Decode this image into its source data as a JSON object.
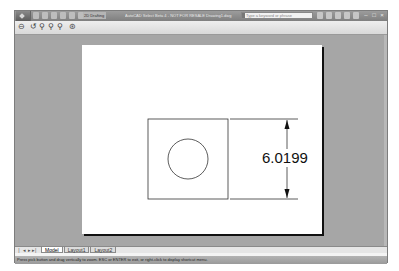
{
  "window": {
    "title": "AutoCAD Select Beta 4 - NOT FOR RESALE   Drawing1.dwg",
    "workspace": "2D Drafting",
    "search_placeholder": "Type a keyword or phrase",
    "controls": [
      "minimize",
      "maximize",
      "close"
    ],
    "control_glyphs": [
      "–",
      "□",
      "×"
    ]
  },
  "toolbar": {
    "buttons": [
      {
        "name": "pan",
        "glyph": "⊖"
      },
      {
        "name": "realtime-zoom",
        "glyph": "↺"
      },
      {
        "name": "zoom-window",
        "glyph": "⚲"
      },
      {
        "name": "zoom-previous",
        "glyph": "⚲"
      },
      {
        "name": "zoom-extents",
        "glyph": "⚲"
      },
      {
        "name": "orbit",
        "glyph": "⊛"
      }
    ]
  },
  "drawing": {
    "dimension_value": "6.0199",
    "objects": [
      {
        "type": "rectangle",
        "label": "square"
      },
      {
        "type": "circle",
        "label": "circle"
      },
      {
        "type": "linear-dimension",
        "label": "vertical dimension"
      }
    ]
  },
  "layout_tabs": {
    "nav": [
      "|◂",
      "◂",
      "▸",
      "▸|"
    ],
    "tabs": [
      {
        "label": "Model",
        "active": true
      },
      {
        "label": "Layout1",
        "active": false
      },
      {
        "label": "Layout2",
        "active": false
      }
    ]
  },
  "status": {
    "prompt": "Press pick button and drag vertically to zoom. ESC or ENTER to exit, or right-click to display shortcut menu."
  }
}
